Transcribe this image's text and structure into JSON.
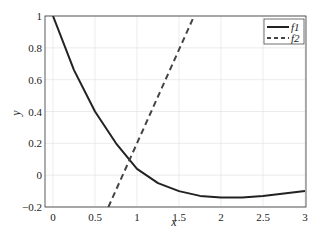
{
  "chart_data": {
    "type": "line",
    "title": "",
    "xlabel": "x",
    "ylabel": "y",
    "xlim": [
      -0.1,
      3
    ],
    "ylim": [
      -0.2,
      1
    ],
    "grid": true,
    "legend_position": "upper right",
    "x_ticks": [
      "0",
      "0.5",
      "1",
      "1.5",
      "2",
      "2.5",
      "3"
    ],
    "y_ticks": [
      "-0.2",
      "0",
      "0.2",
      "0.4",
      "0.6",
      "0.8",
      "1"
    ],
    "series": [
      {
        "name": "f1",
        "style": "solid",
        "color": "#222222",
        "x": [
          0,
          0.25,
          0.5,
          0.75,
          1.0,
          1.25,
          1.5,
          1.75,
          2.0,
          2.25,
          2.5,
          2.75,
          3.0
        ],
        "y": [
          1.0,
          0.66,
          0.4,
          0.2,
          0.04,
          -0.05,
          -0.1,
          -0.13,
          -0.14,
          -0.14,
          -0.13,
          -0.115,
          -0.1
        ]
      },
      {
        "name": "f2",
        "style": "dashed",
        "color": "#444444",
        "x": [
          0.66,
          1.68
        ],
        "y": [
          -0.2,
          1.0
        ]
      }
    ]
  },
  "legend": {
    "items": [
      "f1",
      "f2"
    ]
  },
  "axes": {
    "xlabel": "x",
    "ylabel": "y"
  }
}
